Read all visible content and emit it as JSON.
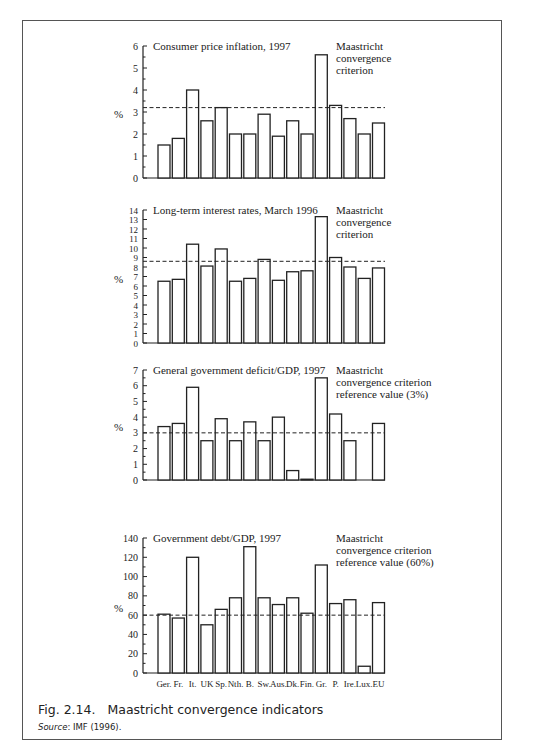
{
  "figure": {
    "caption_number": "Fig. 2.14.",
    "caption_title": "Maastricht convergence indicators",
    "source_label": "Source",
    "source_text": ": IMF (1996)."
  },
  "chart_data": [
    {
      "type": "bar",
      "title": "Consumer price inflation, 1997",
      "ylabel": "%",
      "xlabel": "",
      "categories": [
        "Ger.",
        "Fr.",
        "It.",
        "UK",
        "Sp.",
        "Nth.",
        "B.",
        "Sw.",
        "Aus.",
        "Dk.",
        "Fin.",
        "Gr.",
        "P.",
        "Ire.",
        "Lux.",
        "EU"
      ],
      "values": [
        1.5,
        1.8,
        4.0,
        2.6,
        3.2,
        2.0,
        2.0,
        2.9,
        1.9,
        2.6,
        2.0,
        5.6,
        3.3,
        2.7,
        2.0,
        2.5
      ],
      "ylim": [
        0,
        6
      ],
      "yticks": [
        0,
        1,
        2,
        3,
        4,
        5,
        6
      ],
      "minor_ticks": true,
      "reference_line": {
        "value": 3.2,
        "label": [
          "Maastricht",
          "convergence",
          "criterion"
        ]
      },
      "grid": false,
      "show_xlabels": false
    },
    {
      "type": "bar",
      "title": "Long-term interest rates, March 1996",
      "ylabel": "%",
      "xlabel": "",
      "categories": [
        "Ger.",
        "Fr.",
        "It.",
        "UK",
        "Sp.",
        "Nth.",
        "B.",
        "Sw.",
        "Aus.",
        "Dk.",
        "Fin.",
        "Gr.",
        "P.",
        "Ire.",
        "Lux.",
        "EU"
      ],
      "values": [
        6.5,
        6.7,
        10.4,
        8.1,
        9.9,
        6.5,
        6.8,
        8.8,
        6.6,
        7.5,
        7.6,
        13.3,
        9.0,
        8.0,
        6.8,
        7.9
      ],
      "ylim": [
        0,
        14
      ],
      "yticks": [
        0,
        1,
        2,
        3,
        4,
        5,
        6,
        7,
        8,
        9,
        10,
        11,
        12,
        13,
        14
      ],
      "minor_ticks": false,
      "reference_line": {
        "value": 8.6,
        "label": [
          "Maastricht",
          "convergence",
          "criterion"
        ]
      },
      "grid": false,
      "show_xlabels": false
    },
    {
      "type": "bar",
      "title": "General government deficit/GDP, 1997",
      "ylabel": "%",
      "xlabel": "",
      "categories": [
        "Ger.",
        "Fr.",
        "It.",
        "UK",
        "Sp.",
        "Nth.",
        "B.",
        "Sw.",
        "Aus.",
        "Dk.",
        "Fin.",
        "Gr.",
        "P.",
        "Ire.",
        "Lux.",
        "EU"
      ],
      "values": [
        3.4,
        3.6,
        5.9,
        2.5,
        3.9,
        2.5,
        3.7,
        2.5,
        4.0,
        0.6,
        0.05,
        6.5,
        4.2,
        2.5,
        0,
        3.6
      ],
      "ylim": [
        0,
        7
      ],
      "yticks": [
        0,
        1,
        2,
        3,
        4,
        5,
        6,
        7
      ],
      "minor_ticks": true,
      "reference_line": {
        "value": 3.0,
        "label": [
          "Maastricht",
          "convergence criterion",
          "reference value (3%)"
        ]
      },
      "grid": false,
      "show_xlabels": false
    },
    {
      "type": "bar",
      "title": "Government debt/GDP, 1997",
      "ylabel": "%",
      "xlabel": "",
      "categories": [
        "Ger.",
        "Fr.",
        "It.",
        "UK",
        "Sp.",
        "Nth.",
        "B.",
        "Sw.",
        "Aus.",
        "Dk.",
        "Fin.",
        "Gr.",
        "P.",
        "Ire.",
        "Lux.",
        "EU"
      ],
      "values": [
        61,
        57,
        120,
        50,
        66,
        78,
        131,
        78,
        71,
        78,
        62,
        112,
        72,
        76,
        7,
        73
      ],
      "ylim": [
        0,
        140
      ],
      "yticks": [
        0,
        20,
        40,
        60,
        80,
        100,
        120,
        140
      ],
      "minor_ticks": true,
      "reference_line": {
        "value": 60,
        "label": [
          "Maastricht",
          "convergence criterion",
          "reference value (60%)"
        ]
      },
      "grid": false,
      "show_xlabels": true
    }
  ]
}
